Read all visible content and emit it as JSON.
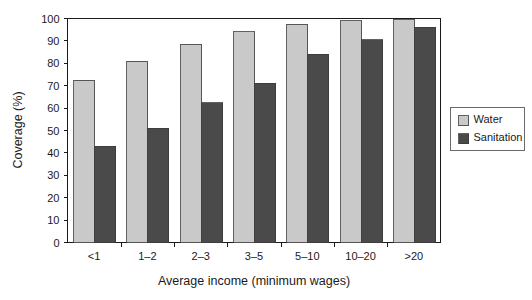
{
  "chart_data": {
    "type": "bar",
    "title": "",
    "xlabel": "Average income (minimum wages)",
    "ylabel": "Coverage (%)",
    "categories": [
      "<1",
      "1–2",
      "2–3",
      "3–5",
      "5–10",
      "10–20",
      ">20"
    ],
    "series": [
      {
        "name": "Water",
        "color": "#c9c9c9",
        "values": [
          72.5,
          81,
          88.5,
          94,
          97.5,
          99,
          99.5
        ]
      },
      {
        "name": "Sanitation",
        "color": "#4a4a4a",
        "values": [
          43,
          51,
          62.5,
          71,
          84,
          90.5,
          96
        ]
      }
    ],
    "ylim": [
      0,
      100
    ],
    "yticks": [
      0,
      10,
      20,
      30,
      40,
      50,
      60,
      70,
      80,
      90,
      100
    ],
    "ytick_labels": [
      "0",
      "10",
      "20",
      "30",
      "40",
      "50",
      "60",
      "70",
      "80",
      "90",
      "100"
    ],
    "grid": false,
    "legend_position": "right-outside",
    "legend_entries": [
      "Water",
      "Sanitation"
    ]
  }
}
